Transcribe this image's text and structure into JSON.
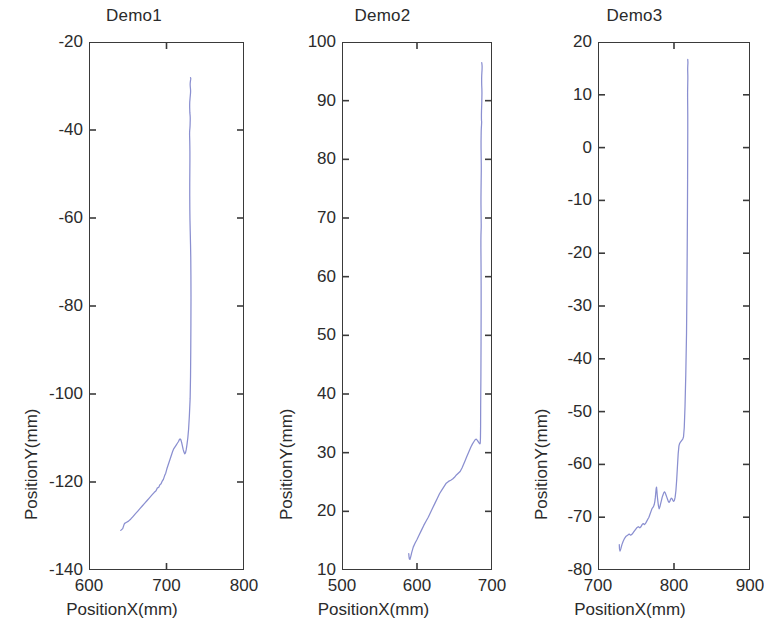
{
  "figure": {
    "background": "#ffffff",
    "line_color": "#8a8fd0",
    "axis_color": "#3a3a3a",
    "panel_count": 3
  },
  "panels": [
    {
      "title": "Demo1",
      "xlabel": "PositionX(mm)",
      "ylabel": "PositionY(mm)",
      "xticks": [
        "600",
        "700",
        "800"
      ],
      "yticks": [
        "-20",
        "-40",
        "-60",
        "-80",
        "-100",
        "-120",
        "-140"
      ]
    },
    {
      "title": "Demo2",
      "xlabel": "PositionX(mm)",
      "ylabel": "PositionY(mm)",
      "xticks": [
        "500",
        "600",
        "700"
      ],
      "yticks": [
        "100",
        "90",
        "80",
        "70",
        "60",
        "50",
        "40",
        "30",
        "20",
        "10"
      ]
    },
    {
      "title": "Demo3",
      "xlabel": "PositionX(mm)",
      "ylabel": "PositionY(mm)",
      "xticks": [
        "700",
        "800",
        "900"
      ],
      "yticks": [
        "20",
        "10",
        "0",
        "-10",
        "-20",
        "-30",
        "-40",
        "-50",
        "-60",
        "-70",
        "-80"
      ]
    }
  ],
  "chart_data": [
    {
      "type": "line",
      "title": "Demo1",
      "xlabel": "PositionX(mm)",
      "ylabel": "PositionY(mm)",
      "xlim": [
        600,
        800
      ],
      "ylim": [
        -140,
        -20
      ],
      "xticks": [
        600,
        700,
        800
      ],
      "yticks": [
        -20,
        -40,
        -60,
        -80,
        -100,
        -120,
        -140
      ],
      "grid": false,
      "legend": null,
      "series": [
        {
          "name": "trajectory",
          "x": [
            641.0,
            643.5,
            645.0,
            646.0,
            648.0,
            651.0,
            654.0,
            657.0,
            660.0,
            663.0,
            666.0,
            669.0,
            672.0,
            675.0,
            678.0,
            681.0,
            684.0,
            686.5,
            688.0,
            690.0,
            691.5,
            693.0,
            694.5,
            696.0,
            697.5,
            699.0,
            700.5,
            702.0,
            703.5,
            705.0,
            706.5,
            708.0,
            709.5,
            711.0,
            712.5,
            714.0,
            715.5,
            716.5,
            717.5,
            718.5,
            719.5,
            720.5,
            721.5,
            722.5,
            723.5,
            724.5,
            725.5,
            726.5,
            727.5,
            728.5,
            729.5,
            730.5,
            731.0,
            731.3,
            731.5,
            731.6,
            731.5,
            731.3,
            731.0,
            730.6,
            730.3,
            730.1,
            730.0,
            730.0,
            730.1,
            730.2,
            730.2,
            730.1,
            730.0,
            729.9,
            729.8,
            729.8,
            729.9,
            730.0,
            730.2,
            730.4,
            730.5,
            730.6,
            730.6,
            730.5,
            730.3,
            730.1,
            730.0,
            729.9,
            729.9,
            730.0,
            730.2,
            730.4,
            730.6,
            730.8,
            731.0,
            731.1,
            731.0,
            730.8,
            730.6,
            730.5,
            730.6,
            730.8,
            731.0,
            731.2,
            731.3,
            731.2,
            731.0
          ],
          "y": [
            -131.0,
            -130.6,
            -129.8,
            -129.4,
            -129.2,
            -128.9,
            -128.4,
            -127.8,
            -127.2,
            -126.6,
            -126.0,
            -125.4,
            -124.8,
            -124.2,
            -123.6,
            -123.0,
            -122.4,
            -122.0,
            -121.4,
            -121.2,
            -120.6,
            -120.4,
            -119.8,
            -119.4,
            -118.6,
            -118.0,
            -117.0,
            -116.2,
            -115.4,
            -114.6,
            -113.8,
            -113.0,
            -112.4,
            -112.0,
            -111.6,
            -111.2,
            -110.8,
            -110.4,
            -110.2,
            -110.4,
            -111.0,
            -111.8,
            -112.6,
            -113.2,
            -113.6,
            -113.4,
            -112.6,
            -111.4,
            -110.0,
            -108.0,
            -105.0,
            -101.0,
            -96.0,
            -90.0,
            -84.0,
            -78.0,
            -73.0,
            -69.0,
            -66.0,
            -63.0,
            -60.5,
            -58.0,
            -55.0,
            -52.0,
            -49.5,
            -47.0,
            -45.0,
            -43.5,
            -42.5,
            -41.8,
            -41.2,
            -40.6,
            -40.2,
            -40.0,
            -39.6,
            -39.0,
            -38.4,
            -37.8,
            -37.2,
            -36.8,
            -36.4,
            -36.0,
            -35.4,
            -34.8,
            -34.2,
            -33.6,
            -33.2,
            -32.8,
            -32.4,
            -32.0,
            -31.6,
            -31.2,
            -30.8,
            -30.4,
            -30.0,
            -29.6,
            -29.3,
            -29.0,
            -28.7,
            -28.5,
            -28.3,
            -28.2,
            -28.1
          ]
        }
      ]
    },
    {
      "type": "line",
      "title": "Demo2",
      "xlabel": "PositionX(mm)",
      "ylabel": "PositionY(mm)",
      "xlim": [
        500,
        700
      ],
      "ylim": [
        10,
        100
      ],
      "xticks": [
        500,
        600,
        700
      ],
      "yticks": [
        100,
        90,
        80,
        70,
        60,
        50,
        40,
        30,
        20,
        10
      ],
      "grid": false,
      "legend": null,
      "series": [
        {
          "name": "trajectory",
          "x": [
            589.0,
            589.3,
            589.8,
            590.5,
            591.5,
            593.0,
            595.0,
            597.5,
            600.0,
            603.0,
            606.0,
            609.0,
            612.0,
            615.0,
            618.0,
            621.0,
            624.0,
            627.0,
            630.0,
            633.0,
            636.0,
            639.0,
            642.0,
            645.0,
            647.5,
            650.0,
            652.5,
            655.0,
            657.5,
            660.0,
            662.0,
            664.0,
            666.0,
            668.0,
            670.0,
            672.0,
            674.0,
            676.0,
            677.5,
            679.0,
            680.5,
            682.0,
            683.0,
            683.8,
            684.3,
            684.6,
            684.8,
            684.9,
            685.2,
            685.4,
            685.5,
            685.5,
            685.4,
            685.3,
            685.2,
            685.2,
            685.3,
            685.4,
            685.5,
            685.6,
            685.6,
            685.5,
            685.4,
            685.3,
            685.3,
            685.4,
            685.5,
            685.6,
            685.7,
            685.7,
            685.6,
            685.5,
            685.4,
            685.4,
            685.5,
            685.6,
            685.8,
            686.0,
            686.1,
            686.2,
            686.1,
            686.0,
            685.9,
            685.9,
            686.0,
            686.2,
            686.4,
            686.5,
            686.6,
            686.5,
            686.3,
            686.2,
            686.2,
            686.3,
            686.5,
            686.7,
            686.8,
            686.8,
            686.6,
            686.4,
            686.3
          ],
          "y": [
            12.8,
            12.3,
            11.9,
            11.8,
            12.2,
            13.0,
            13.9,
            14.6,
            15.2,
            16.0,
            16.8,
            17.6,
            18.3,
            19.0,
            19.8,
            20.6,
            21.4,
            22.2,
            23.0,
            23.6,
            24.2,
            24.8,
            25.1,
            25.3,
            25.5,
            25.8,
            26.2,
            26.5,
            26.8,
            27.4,
            28.0,
            28.6,
            29.2,
            29.8,
            30.4,
            31.0,
            31.5,
            31.9,
            32.2,
            32.3,
            32.1,
            31.8,
            31.6,
            31.5,
            31.6,
            32.5,
            34.5,
            38.0,
            43.0,
            49.0,
            54.0,
            58.5,
            61.5,
            63.5,
            65.0,
            66.2,
            67.2,
            67.6,
            68.0,
            68.4,
            69.0,
            70.0,
            71.2,
            72.4,
            73.6,
            74.8,
            76.0,
            77.0,
            78.0,
            79.0,
            80.0,
            81.0,
            82.0,
            83.0,
            84.0,
            84.8,
            85.4,
            85.8,
            86.1,
            86.4,
            86.5,
            86.6,
            87.0,
            87.6,
            88.3,
            89.0,
            89.8,
            90.6,
            91.3,
            92.0,
            92.6,
            93.2,
            93.8,
            94.3,
            94.8,
            95.2,
            95.6,
            95.9,
            96.2,
            96.4,
            96.5
          ]
        }
      ]
    },
    {
      "type": "line",
      "title": "Demo3",
      "xlabel": "PositionX(mm)",
      "ylabel": "PositionY(mm)",
      "xlim": [
        700,
        900
      ],
      "ylim": [
        -80,
        20
      ],
      "xticks": [
        700,
        800,
        900
      ],
      "yticks": [
        20,
        10,
        0,
        -10,
        -20,
        -30,
        -40,
        -50,
        -60,
        -70,
        -80
      ],
      "grid": false,
      "legend": null,
      "series": [
        {
          "name": "trajectory",
          "x": [
            728.0,
            728.3,
            729.0,
            730.0,
            731.5,
            733.0,
            735.0,
            737.0,
            739.0,
            741.0,
            743.0,
            745.0,
            747.0,
            749.0,
            751.0,
            753.0,
            755.0,
            756.5,
            758.0,
            759.5,
            761.0,
            762.5,
            764.0,
            765.5,
            767.0,
            768.5,
            770.0,
            771.0,
            772.0,
            773.0,
            774.0,
            774.8,
            775.5,
            776.0,
            776.5,
            777.0,
            777.5,
            778.0,
            778.8,
            779.5,
            780.5,
            781.5,
            782.5,
            783.5,
            784.5,
            785.5,
            786.5,
            787.5,
            788.5,
            789.5,
            790.5,
            791.5,
            792.5,
            793.5,
            794.5,
            795.5,
            796.5,
            797.5,
            798.5,
            799.5,
            800.5,
            801.5,
            802.5,
            803.5,
            804.5,
            805.5,
            806.5,
            807.5,
            808.5,
            809.5,
            810.5,
            811.5,
            812.5,
            813.5,
            814.5,
            815.5,
            816.5,
            817.0,
            817.4,
            817.7,
            817.9,
            818.0,
            818.1,
            818.1,
            818.0,
            817.9,
            817.9,
            818.0,
            818.1,
            818.2,
            818.2,
            818.1,
            818.0,
            818.0,
            818.1,
            818.2,
            818.3,
            818.3,
            818.2,
            818.1,
            818.1
          ],
          "y": [
            -75.2,
            -76.0,
            -76.4,
            -76.0,
            -75.2,
            -74.6,
            -74.0,
            -73.6,
            -73.4,
            -73.2,
            -73.4,
            -73.2,
            -72.8,
            -72.4,
            -72.0,
            -71.8,
            -72.0,
            -71.8,
            -71.4,
            -71.2,
            -71.4,
            -71.2,
            -70.8,
            -70.4,
            -70.0,
            -69.4,
            -68.8,
            -68.4,
            -68.2,
            -68.0,
            -67.6,
            -67.0,
            -66.2,
            -65.4,
            -64.6,
            -64.3,
            -65.0,
            -66.0,
            -67.0,
            -67.8,
            -68.4,
            -68.0,
            -67.4,
            -66.8,
            -66.2,
            -65.8,
            -65.4,
            -65.2,
            -65.4,
            -65.8,
            -66.2,
            -66.6,
            -67.0,
            -67.2,
            -67.0,
            -66.6,
            -66.4,
            -66.5,
            -66.8,
            -67.0,
            -66.8,
            -66.2,
            -65.0,
            -63.0,
            -60.5,
            -58.0,
            -56.5,
            -56.0,
            -55.8,
            -55.6,
            -55.4,
            -55.2,
            -54.8,
            -53.0,
            -49.0,
            -43.0,
            -35.0,
            -27.0,
            -19.0,
            -12.0,
            -6.0,
            -1.0,
            3.0,
            6.0,
            8.0,
            9.5,
            10.5,
            11.5,
            12.3,
            13.0,
            13.6,
            14.1,
            14.6,
            15.0,
            15.4,
            15.7,
            16.0,
            16.2,
            16.4,
            16.6,
            16.7
          ]
        }
      ]
    }
  ]
}
